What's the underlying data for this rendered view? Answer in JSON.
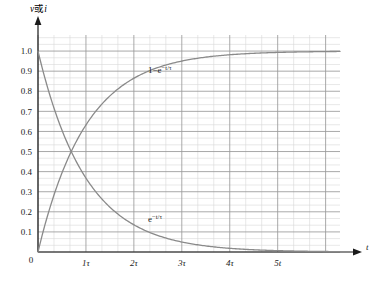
{
  "chart_data": {
    "type": "line",
    "title": "",
    "xlabel": "t",
    "ylabel": "v或i",
    "xlim": [
      0,
      6.3
    ],
    "ylim": [
      0,
      1.08
    ],
    "grid": true,
    "legend": "inline-annotations",
    "x_tick_labels": [
      "0",
      "1τ",
      "2τ",
      "3τ",
      "4τ",
      "5t"
    ],
    "x_tick_values": [
      0,
      1,
      2,
      3,
      4,
      5
    ],
    "y_tick_labels": [
      "0.1",
      "0.2",
      "0.3",
      "0.4",
      "0.5",
      "0.6",
      "0.7",
      "0.8",
      "0.9",
      "1.0"
    ],
    "y_tick_values": [
      0.1,
      0.2,
      0.3,
      0.4,
      0.5,
      0.6,
      0.7,
      0.8,
      0.9,
      1.0
    ],
    "origin_label": "0",
    "axis_arrow_x_label": "t",
    "series": [
      {
        "name": "rising",
        "label": "1−e",
        "label_exponent": "−t/τ",
        "formula": "1-exp(-t/tau)",
        "x": [
          0,
          0.1,
          0.2,
          0.3,
          0.4,
          0.5,
          0.6,
          0.7,
          0.8,
          0.9,
          1.0,
          1.2,
          1.4,
          1.6,
          1.8,
          2.0,
          2.3,
          2.6,
          3.0,
          3.4,
          3.8,
          4.2,
          4.6,
          5.0,
          5.5,
          6.0,
          6.3
        ],
        "values": [
          0.0,
          0.095,
          0.181,
          0.259,
          0.33,
          0.393,
          0.451,
          0.503,
          0.551,
          0.593,
          0.632,
          0.699,
          0.753,
          0.798,
          0.835,
          0.865,
          0.9,
          0.926,
          0.95,
          0.967,
          0.978,
          0.985,
          0.99,
          0.993,
          0.996,
          0.998,
          0.998
        ]
      },
      {
        "name": "decaying",
        "label": "e",
        "label_exponent": "−t/τ",
        "formula": "exp(-t/tau)",
        "x": [
          0,
          0.1,
          0.2,
          0.3,
          0.4,
          0.5,
          0.6,
          0.7,
          0.8,
          0.9,
          1.0,
          1.2,
          1.4,
          1.6,
          1.8,
          2.0,
          2.3,
          2.6,
          3.0,
          3.4,
          3.8,
          4.2,
          4.6,
          5.0,
          5.5,
          6.0,
          6.3
        ],
        "values": [
          1.0,
          0.905,
          0.819,
          0.741,
          0.67,
          0.607,
          0.549,
          0.497,
          0.449,
          0.407,
          0.368,
          0.301,
          0.247,
          0.202,
          0.165,
          0.135,
          0.1,
          0.074,
          0.05,
          0.033,
          0.022,
          0.015,
          0.01,
          0.007,
          0.004,
          0.002,
          0.002
        ]
      }
    ],
    "intersection": {
      "x": 0.693,
      "y": 0.5
    },
    "colors": {
      "curve": "#8a8a8a",
      "axis": "#1a1a1a",
      "grid_minor": "#d9d9d9",
      "grid_major": "#9a9a9a",
      "background": "#ffffff"
    }
  },
  "caption": {
    "text": ""
  }
}
